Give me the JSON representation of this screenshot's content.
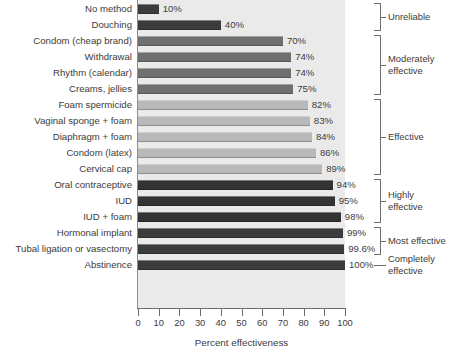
{
  "chart_data": {
    "type": "bar",
    "orientation": "horizontal",
    "title": "",
    "xlabel": "Percent effectiveness",
    "ylabel": "",
    "xlim": [
      0,
      100
    ],
    "grid": false,
    "legend": "none",
    "xticks": [
      0,
      10,
      20,
      30,
      40,
      50,
      60,
      70,
      80,
      90,
      100
    ],
    "xtick_labels": [
      "0",
      "10",
      "20",
      "30",
      "40",
      "50",
      "60",
      "70",
      "80",
      "90",
      "100"
    ],
    "categories": [
      "No method",
      "Douching",
      "Condom (cheap brand)",
      "Withdrawal",
      "Rhythm (calendar)",
      "Creams, jellies",
      "Foam spermicide",
      "Vaginal sponge + foam",
      "Diaphragm + foam",
      "Condom (latex)",
      "Cervical cap",
      "Oral contraceptive",
      "IUD",
      "IUD + foam",
      "Hormonal implant",
      "Tubal ligation or vasectomy",
      "Abstinence"
    ],
    "values": [
      10,
      40,
      70,
      74,
      74,
      75,
      82,
      83,
      84,
      86,
      89,
      94,
      95,
      98,
      99,
      99.6,
      100
    ],
    "value_labels": [
      "10%",
      "40%",
      "70%",
      "74%",
      "74%",
      "75%",
      "82%",
      "83%",
      "84%",
      "86%",
      "89%",
      "94%",
      "95%",
      "98%",
      "99%",
      "99.6%",
      "100%"
    ],
    "bar_shades": [
      "dark",
      "dark",
      "mid",
      "mid",
      "mid",
      "mid",
      "light",
      "light",
      "light",
      "light",
      "light",
      "vdark",
      "vdark",
      "vdark",
      "dark",
      "dark",
      "dark"
    ],
    "groups": [
      {
        "label": "Unreliable",
        "start": 0,
        "end": 1,
        "style": "bracket"
      },
      {
        "label": "Moderately\neffective",
        "start": 2,
        "end": 5,
        "style": "bracket"
      },
      {
        "label": "Effective",
        "start": 6,
        "end": 10,
        "style": "bracket"
      },
      {
        "label": "Highly\neffective",
        "start": 11,
        "end": 13,
        "style": "bracket"
      },
      {
        "label": "Most effective",
        "start": 14,
        "end": 15,
        "style": "bracket"
      },
      {
        "label": "Completely\neffective",
        "start": 16,
        "end": 16,
        "style": "line"
      }
    ],
    "colors": {
      "plot_background": "#eaeaea",
      "page_background": "#ffffff",
      "bar_dark": "#3c3c3c",
      "bar_mid": "#6f6f6f",
      "bar_light": "#b9b9b9",
      "bar_vdark": "#333333",
      "axis": "#6e6e6e",
      "text": "#3b3b3b"
    }
  }
}
